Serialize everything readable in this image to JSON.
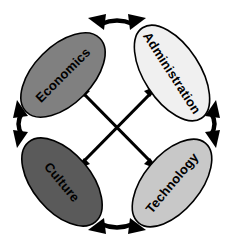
{
  "diagram": {
    "type": "cyclic-interaction-diagram",
    "background_color": "#ffffff",
    "outline_color": "#000000",
    "nodes": [
      {
        "id": "economics",
        "label": "Economics",
        "position": "top-left",
        "fill_color": "#808080",
        "text_color": "#000000",
        "cx": 63,
        "cy": 75,
        "rx": 52,
        "ry": 29,
        "rotation": -45
      },
      {
        "id": "administration",
        "label": "Administration",
        "position": "top-right",
        "fill_color": "#f0f0f0",
        "text_color": "#000000",
        "cx": 172,
        "cy": 73,
        "rx": 54,
        "ry": 28,
        "rotation": 57
      },
      {
        "id": "culture",
        "label": "Culture",
        "position": "bottom-left",
        "fill_color": "#5a5a5a",
        "text_color": "#000000",
        "cx": 62,
        "cy": 182,
        "rx": 52,
        "ry": 29,
        "rotation": 50
      },
      {
        "id": "technology",
        "label": "Technology",
        "position": "bottom-right",
        "fill_color": "#c8c8c8",
        "text_color": "#000000",
        "cx": 172,
        "cy": 183,
        "rx": 52,
        "ry": 28,
        "rotation": -50
      }
    ],
    "arc_connectors": [
      {
        "id": "arc-top",
        "from": "economics",
        "to": "administration",
        "style": "double-headed-curved-arrow",
        "position": "top"
      },
      {
        "id": "arc-right",
        "from": "administration",
        "to": "technology",
        "style": "double-headed-curved-arrow",
        "position": "right"
      },
      {
        "id": "arc-bottom",
        "from": "technology",
        "to": "culture",
        "style": "double-headed-curved-arrow",
        "position": "bottom"
      },
      {
        "id": "arc-left",
        "from": "culture",
        "to": "economics",
        "style": "double-headed-curved-arrow",
        "position": "left"
      }
    ],
    "diagonal_connectors": [
      {
        "id": "diagonal-economics-technology",
        "from": "economics",
        "to": "technology",
        "style": "double-headed-straight-arrow"
      },
      {
        "id": "diagonal-administration-culture",
        "from": "administration",
        "to": "culture",
        "style": "double-headed-straight-arrow"
      }
    ]
  }
}
